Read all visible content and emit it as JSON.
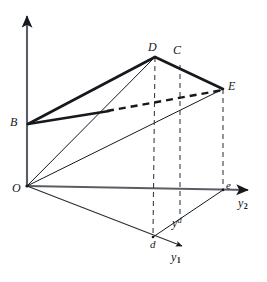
{
  "figure": {
    "background_color": "#ffffff",
    "line_color": "#15181c",
    "axis_color": "#4a4e54",
    "labels": [
      {
        "id": "label-O",
        "text": "O",
        "sub": "",
        "sup": "",
        "x": 12,
        "y": 182
      },
      {
        "id": "label-B",
        "text": "B",
        "sub": "",
        "sup": "",
        "x": 10,
        "y": 116
      },
      {
        "id": "label-D",
        "text": "D",
        "sub": "",
        "sup": "",
        "x": 148,
        "y": 41
      },
      {
        "id": "label-C",
        "text": "C",
        "sub": "",
        "sup": "",
        "x": 173,
        "y": 44
      },
      {
        "id": "label-E",
        "text": "E",
        "sub": "",
        "sup": "",
        "x": 228,
        "y": 80
      },
      {
        "id": "label-e",
        "text": "e",
        "sub": "",
        "sup": "",
        "x": 226,
        "y": 180
      },
      {
        "id": "label-d",
        "text": "d",
        "sub": "",
        "sup": "",
        "x": 150,
        "y": 239
      },
      {
        "id": "label-yd",
        "text": "y",
        "sub": "",
        "sup": "d",
        "x": 172,
        "y": 217
      },
      {
        "id": "label-y2",
        "text": "y",
        "sub": "2",
        "sup": "",
        "x": 238,
        "y": 197
      },
      {
        "id": "label-y1",
        "text": "y",
        "sub": "1",
        "sup": "",
        "x": 171,
        "y": 251
      }
    ],
    "points": {
      "O": {
        "x": 27,
        "y": 186
      },
      "B": {
        "x": 28,
        "y": 124
      },
      "D": {
        "x": 155,
        "y": 57
      },
      "C": {
        "x": 180,
        "y": 65
      },
      "E": {
        "x": 223,
        "y": 89
      },
      "e": {
        "x": 223,
        "y": 190
      },
      "d": {
        "x": 153,
        "y": 237
      },
      "yd": {
        "x": 180,
        "y": 218
      },
      "B_to_E_break": {
        "x": 108,
        "y": 111
      },
      "axis_z_tip": {
        "x": 27,
        "y": 11
      },
      "axis_y2_tip": {
        "x": 254,
        "y": 190
      },
      "axis_y1_tip": {
        "x": 187,
        "y": 249
      }
    },
    "segments": [
      {
        "name": "z-axis",
        "kind": "axis-arrow",
        "from": "O",
        "to": "axis_z_tip"
      },
      {
        "name": "y2-axis",
        "kind": "axis-arrow",
        "from": "O",
        "to": "axis_y2_tip"
      },
      {
        "name": "y1-axis",
        "kind": "axis-arrow",
        "from": "O",
        "to": "axis_y1_tip"
      },
      {
        "name": "segment-B-D",
        "kind": "bold-solid",
        "from": "B",
        "to": "D"
      },
      {
        "name": "segment-D-E",
        "kind": "bold-solid",
        "from": "D",
        "to": "E"
      },
      {
        "name": "segment-B-break",
        "kind": "bold-solid",
        "from": "B",
        "to": "B_to_E_break"
      },
      {
        "name": "segment-break-E",
        "kind": "bold-dashed",
        "from": "B_to_E_break",
        "to": "E"
      },
      {
        "name": "segment-O-D",
        "kind": "thin-solid",
        "from": "O",
        "to": "D"
      },
      {
        "name": "segment-O-E",
        "kind": "thin-solid",
        "from": "O",
        "to": "E"
      },
      {
        "name": "segment-O-d",
        "kind": "thin-solid",
        "from": "O",
        "to": "d"
      },
      {
        "name": "segment-d-e",
        "kind": "thin-solid",
        "from": "d",
        "to": "e"
      },
      {
        "name": "drop-line-D-d",
        "kind": "thin-dashed",
        "from": "D",
        "to": "d"
      },
      {
        "name": "drop-line-C-yd",
        "kind": "thin-dashed",
        "from": "C",
        "to": "yd"
      },
      {
        "name": "drop-line-E-e",
        "kind": "thin-dashed",
        "from": "E",
        "to": "e"
      }
    ]
  }
}
